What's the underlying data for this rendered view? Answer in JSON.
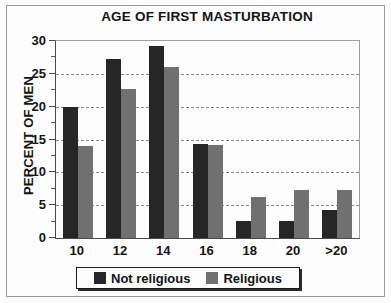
{
  "chart_data": {
    "type": "bar",
    "title": "AGE OF FIRST MASTURBATION",
    "xlabel": "",
    "ylabel": "PERCENT OF MEN",
    "categories": [
      "10",
      "12",
      "14",
      "16",
      "18",
      "20",
      ">20"
    ],
    "series": [
      {
        "name": "Not religious",
        "color": "#262626",
        "values": [
          20.0,
          27.2,
          29.2,
          14.3,
          2.6,
          2.6,
          4.2
        ]
      },
      {
        "name": "Religious",
        "color": "#707070",
        "values": [
          14.0,
          22.7,
          26.0,
          14.2,
          6.3,
          7.3,
          7.3
        ]
      }
    ],
    "ylim": [
      0,
      30
    ],
    "yticks": [
      0,
      5,
      10,
      15,
      20,
      25,
      30
    ],
    "ytick_labels": [
      "0",
      "5",
      "10",
      "15",
      "20",
      "25",
      "30"
    ],
    "yminor_ticks": [
      2.5,
      7.5,
      12.5,
      17.5,
      22.5,
      27.5
    ],
    "gridlines": [
      5,
      10,
      15,
      20,
      25
    ],
    "grid": true,
    "legend_position": "bottom"
  },
  "legend": {
    "entries": [
      {
        "label": "Not religious"
      },
      {
        "label": "Religious"
      }
    ]
  }
}
